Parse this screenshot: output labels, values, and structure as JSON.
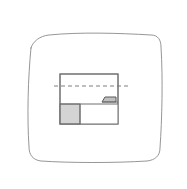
{
  "canvas": {
    "width": 187,
    "height": 189,
    "background_color": "#ffffff",
    "title": "Hand-drawn sketch frame with sectional rectangle diagram"
  },
  "frame": {
    "name": "hand-drawn rounded square border",
    "stroke_color": "#8a8a8a",
    "stroke_width": 0.9,
    "fill": "none",
    "path": "M 31 48 C 33 41 40 36 49 35 C 79 32 118 33 151 35 C 158 35 161 40 161 47 C 163 79 162 119 160 148 C 160 156 155 160 147 161 C 115 163 70 163 41 161 C 33 160 29 155 29 147 C 27 117 28 78 31 48 Z"
  },
  "diagram": {
    "name": "sectional rectangle",
    "stroke_color": "#6e6e6e",
    "stroke_width": 1.0,
    "fill_color": "#ffffff",
    "outline": {
      "x": 60,
      "y": 74,
      "width": 58,
      "height": 50
    },
    "shaded_region": {
      "name": "hatched lower-left block",
      "x": 60,
      "y": 104,
      "width": 20,
      "height": 20,
      "fill_color": "#d4d4d4",
      "stroke_color": "#6e6e6e"
    },
    "lower_band": {
      "name": "lower band",
      "x": 60,
      "y": 104,
      "width": 58,
      "height": 20,
      "fill_color": "#ffffff"
    },
    "divider": {
      "name": "vertical divider",
      "x": 80,
      "y1": 104,
      "y2": 124
    },
    "step_detail": {
      "name": "stepped notch",
      "fill_color": "#bfbfbf",
      "stroke_color": "#5a5a5a",
      "points": "102,102 105,97 116,97 116,102"
    },
    "centerline": {
      "name": "dashed symmetry centerline",
      "x1": 54,
      "x2": 130,
      "y": 86,
      "stroke_color": "#707070",
      "stroke_width": 0.9,
      "dash_pattern": "4 3"
    }
  },
  "labels": {
    "frame_label": "sketch frame",
    "diagram_label": "section view rectangle",
    "shaded_label": "shaded block",
    "centerline_label": "centerline",
    "step_label": "step detail"
  }
}
